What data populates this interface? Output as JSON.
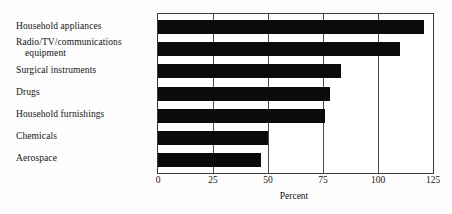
{
  "chart_data": {
    "type": "bar",
    "orientation": "horizontal",
    "title": "",
    "subtitle": "",
    "xlabel": "Percent",
    "ylabel": "",
    "xlim": [
      0,
      125
    ],
    "xticks": [
      0,
      25,
      50,
      75,
      100,
      125
    ],
    "xtick_labels": [
      "0",
      "25",
      "50",
      "75",
      "100",
      "125"
    ],
    "grid": true,
    "grid_axis": "x",
    "legend": null,
    "bar_color": "#0b0b0b",
    "categories": [
      "Household appliances",
      "Radio/TV/communications equipment",
      "Surgical instruments",
      "Drugs",
      "Household furnishings",
      "Chemicals",
      "Aerospace"
    ],
    "category_lines": [
      [
        "Household appliances"
      ],
      [
        "Radio/TV/communications",
        "equipment"
      ],
      [
        "Surgical instruments"
      ],
      [
        "Drugs"
      ],
      [
        "Household furnishings"
      ],
      [
        "Chemicals"
      ],
      [
        "Aerospace"
      ]
    ],
    "values": [
      121,
      110,
      83,
      78,
      76,
      50,
      47
    ]
  },
  "axis": {
    "x_title": "Percent"
  }
}
